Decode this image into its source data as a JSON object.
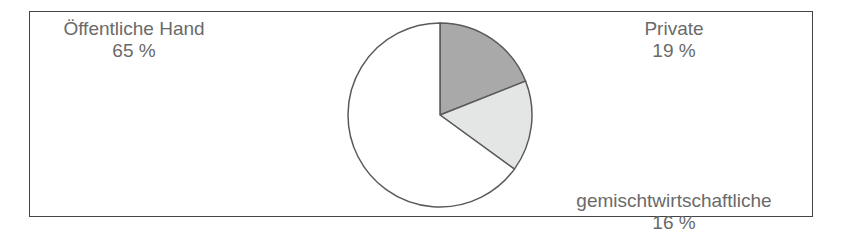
{
  "chart_data": {
    "type": "pie",
    "title": "",
    "slices": [
      {
        "label": "Private",
        "value": 19,
        "value_label": "19 %",
        "color": "#a9a9a9"
      },
      {
        "label": "gemischtwirtschaftliche",
        "value": 16,
        "value_label": "16 %",
        "color": "#e4e6e6"
      },
      {
        "label": "Öffentliche  Hand",
        "value": 65,
        "value_label": "65 %",
        "color": "#ffffff"
      }
    ],
    "start_angle_deg": 0,
    "direction": "clockwise",
    "legend": "none"
  }
}
